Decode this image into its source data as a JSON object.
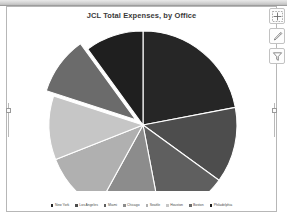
{
  "chart_data": {
    "type": "pie",
    "title": "JCL Total Expenses, by Office",
    "xlabel": "",
    "ylabel": "",
    "legend_position": "bottom",
    "grid": false,
    "categories": [
      "New York",
      "Los Angeles",
      "Miami",
      "Chicago",
      "Seattle",
      "Houston",
      "Boston",
      "Philadelphia"
    ],
    "values": [
      22,
      13,
      12,
      11,
      11,
      11,
      10,
      10
    ],
    "colors": [
      "#262626",
      "#4d4d4d",
      "#5f5f5f",
      "#8c8c8c",
      "#b0b0b0",
      "#c6c6c6",
      "#6b6b6b",
      "#1f1f1f"
    ],
    "exploded_slice": "Boston",
    "start_angle_deg": 0
  },
  "chart": {
    "title": "JCL Total Expenses, by Office"
  },
  "legend": {
    "items": [
      {
        "label": "New York",
        "color": "#262626"
      },
      {
        "label": "Los Angeles",
        "color": "#4d4d4d"
      },
      {
        "label": "Miami",
        "color": "#5f5f5f"
      },
      {
        "label": "Chicago",
        "color": "#8c8c8c"
      },
      {
        "label": "Seattle",
        "color": "#b0b0b0"
      },
      {
        "label": "Houston",
        "color": "#c6c6c6"
      },
      {
        "label": "Boston",
        "color": "#6b6b6b"
      },
      {
        "label": "Philadelphia",
        "color": "#1f1f1f"
      }
    ]
  },
  "chart_buttons": [
    {
      "name": "chart-elements-button",
      "icon": "plus-icon",
      "tooltip": "Chart Elements"
    },
    {
      "name": "chart-styles-button",
      "icon": "brush-icon",
      "tooltip": "Chart Styles"
    },
    {
      "name": "chart-filters-button",
      "icon": "funnel-icon",
      "tooltip": "Chart Filters"
    }
  ]
}
